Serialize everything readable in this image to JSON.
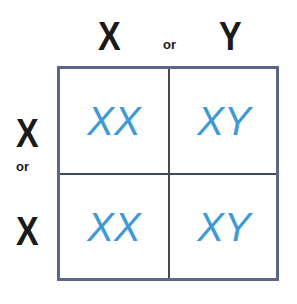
{
  "top_header": {
    "left": "X",
    "connector": "or",
    "right": "Y"
  },
  "side_header": {
    "top": "X",
    "connector": "or",
    "bottom": "X"
  },
  "cells": [
    [
      "XX",
      "XY"
    ],
    [
      "XX",
      "XY"
    ]
  ],
  "colors": {
    "cell_text": "#3d9ad6",
    "border": "#5b6785",
    "divider": "#444a55",
    "header_text": "#1a1a1a"
  }
}
